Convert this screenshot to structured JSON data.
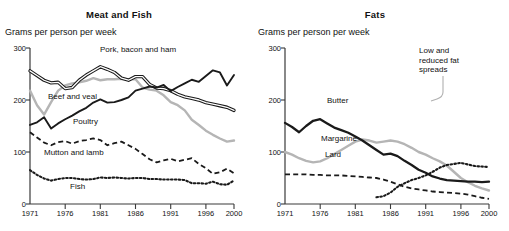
{
  "chart_data": [
    {
      "type": "line",
      "title": "Meat and Fish",
      "ylabel": "Grams per person per week",
      "xlabel": "",
      "ylim": [
        0,
        300
      ],
      "xlim": [
        1971,
        2000
      ],
      "yticks": [
        "0",
        "100",
        "200",
        "300"
      ],
      "xticks": [
        "1971",
        "1976",
        "1981",
        "1986",
        "1991",
        "1996",
        "2000"
      ],
      "grid": false,
      "legend": "inline-labels",
      "x": [
        1971,
        1972,
        1973,
        1974,
        1975,
        1976,
        1977,
        1978,
        1979,
        1980,
        1981,
        1982,
        1983,
        1984,
        1985,
        1986,
        1987,
        1988,
        1989,
        1990,
        1991,
        1992,
        1993,
        1994,
        1995,
        1996,
        1997,
        1998,
        1999,
        2000
      ],
      "series": [
        {
          "name": "Pork, bacon and ham",
          "style": "double-line",
          "color": "#1a1a1a",
          "values": [
            256,
            247,
            238,
            233,
            234,
            222,
            224,
            238,
            248,
            256,
            264,
            259,
            253,
            242,
            238,
            245,
            245,
            230,
            223,
            222,
            218,
            211,
            206,
            203,
            200,
            195,
            192,
            189,
            186,
            180
          ]
        },
        {
          "name": "Beef and veal",
          "style": "solid-grey",
          "color": "#b5b5b5",
          "values": [
            218,
            190,
            172,
            196,
            218,
            228,
            232,
            234,
            237,
            242,
            238,
            240,
            240,
            241,
            240,
            240,
            224,
            220,
            218,
            209,
            196,
            190,
            180,
            162,
            152,
            141,
            133,
            126,
            120,
            122
          ]
        },
        {
          "name": "Poultry",
          "style": "solid-black",
          "color": "#1a1a1a",
          "values": [
            152,
            157,
            167,
            145,
            155,
            163,
            170,
            178,
            185,
            195,
            201,
            195,
            196,
            200,
            205,
            218,
            222,
            226,
            224,
            229,
            217,
            225,
            232,
            239,
            235,
            246,
            257,
            253,
            228,
            248
          ]
        },
        {
          "name": "Mutton and lamb",
          "style": "dashed",
          "color": "#1a1a1a",
          "values": [
            138,
            128,
            118,
            113,
            119,
            121,
            116,
            121,
            123,
            126,
            123,
            113,
            117,
            120,
            113,
            106,
            96,
            86,
            80,
            84,
            87,
            82,
            85,
            88,
            77,
            69,
            58,
            61,
            68,
            59
          ]
        },
        {
          "name": "Fish",
          "style": "dotted",
          "color": "#1a1a1a",
          "values": [
            65,
            56,
            49,
            45,
            48,
            50,
            50,
            48,
            47,
            48,
            51,
            50,
            51,
            50,
            49,
            50,
            50,
            48,
            48,
            47,
            47,
            47,
            46,
            40,
            40,
            39,
            43,
            38,
            37,
            45
          ]
        }
      ]
    },
    {
      "type": "line",
      "title": "Fats",
      "ylabel": "Grams per person per week",
      "xlabel": "",
      "ylim": [
        0,
        300
      ],
      "xlim": [
        1971,
        2000
      ],
      "yticks": [
        "0",
        "100",
        "200",
        "300"
      ],
      "xticks": [
        "1971",
        "1976",
        "1981",
        "1986",
        "1991",
        "1996",
        "2000"
      ],
      "grid": false,
      "legend": "inline-labels",
      "x": [
        1971,
        1972,
        1973,
        1974,
        1975,
        1976,
        1977,
        1978,
        1979,
        1980,
        1981,
        1982,
        1983,
        1984,
        1985,
        1986,
        1987,
        1988,
        1989,
        1990,
        1991,
        1992,
        1993,
        1994,
        1995,
        1996,
        1997,
        1998,
        1999,
        2000
      ],
      "series": [
        {
          "name": "Butter",
          "style": "solid-black",
          "color": "#1a1a1a",
          "values": [
            156,
            148,
            138,
            150,
            160,
            163,
            155,
            147,
            142,
            137,
            130,
            122,
            113,
            104,
            95,
            97,
            92,
            83,
            75,
            66,
            60,
            53,
            49,
            46,
            45,
            44,
            43,
            43,
            42,
            43
          ]
        },
        {
          "name": "Margarine",
          "style": "solid-grey",
          "color": "#b5b5b5",
          "values": [
            100,
            95,
            88,
            83,
            80,
            82,
            88,
            96,
            104,
            112,
            120,
            124,
            122,
            118,
            120,
            122,
            120,
            115,
            108,
            100,
            95,
            88,
            82,
            74,
            62,
            50,
            42,
            35,
            30,
            26
          ]
        },
        {
          "name": "Lard",
          "style": "dashed",
          "color": "#1a1a1a",
          "values": [
            57,
            57,
            57,
            57,
            56,
            56,
            55,
            55,
            55,
            54,
            53,
            52,
            51,
            50,
            47,
            43,
            38,
            33,
            30,
            28,
            26,
            24,
            23,
            22,
            21,
            20,
            18,
            15,
            12,
            10
          ]
        },
        {
          "name": "Low and reduced fat spreads",
          "style": "dotted",
          "color": "#1a1a1a",
          "values": [
            null,
            null,
            null,
            null,
            null,
            null,
            null,
            null,
            null,
            null,
            null,
            null,
            null,
            13,
            15,
            22,
            33,
            40,
            46,
            50,
            55,
            62,
            70,
            75,
            77,
            79,
            76,
            73,
            72,
            71
          ]
        }
      ],
      "annotations": [
        {
          "text": "Low and reduced fat spreads",
          "leader_line": true
        }
      ]
    }
  ],
  "panels": [
    {
      "title": "Meat and Fish",
      "caption": "Grams per person per week",
      "yticks": [
        "300",
        "200",
        "100",
        "0"
      ],
      "xticks": [
        "1971",
        "1976",
        "1981",
        "1986",
        "1991",
        "1996",
        "2000"
      ],
      "labels": [
        {
          "key": "pork",
          "text": "Pork, bacon and ham"
        },
        {
          "key": "beef",
          "text": "Beef and veal"
        },
        {
          "key": "poultry",
          "text": "Poultry"
        },
        {
          "key": "mutton",
          "text": "Mutton and lamb"
        },
        {
          "key": "fish",
          "text": "Fish"
        }
      ]
    },
    {
      "title": "Fats",
      "caption": "Grams per person per week",
      "yticks": [
        "300",
        "200",
        "100",
        "0"
      ],
      "xticks": [
        "1971",
        "1976",
        "1981",
        "1986",
        "1991",
        "1996",
        "2000"
      ],
      "labels": [
        {
          "key": "butter",
          "text": "Butter"
        },
        {
          "key": "margarine",
          "text": "Margarine"
        },
        {
          "key": "lard",
          "text": "Lard"
        },
        {
          "key": "spreads",
          "text": "Low and reduced fat spreads"
        }
      ]
    }
  ],
  "colors": {
    "ink": "#1a1a1a",
    "grey_series": "#b5b5b5",
    "axis": "#3a3a3a",
    "background": "#ffffff"
  }
}
